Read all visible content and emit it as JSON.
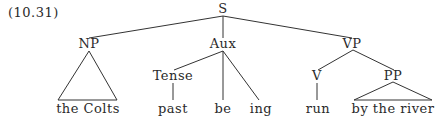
{
  "example_number": "(10.31)",
  "tree": {
    "root": "S",
    "nodes": {
      "S": "S",
      "NP": "NP",
      "Aux": "Aux",
      "VP": "VP",
      "Tense": "Tense",
      "V": "V",
      "PP": "PP"
    },
    "leaves": {
      "np_leaf": "the Colts",
      "tense_leaf": "past",
      "be": "be",
      "ing": "ing",
      "v_leaf": "run",
      "pp_leaf": "by the river"
    }
  }
}
